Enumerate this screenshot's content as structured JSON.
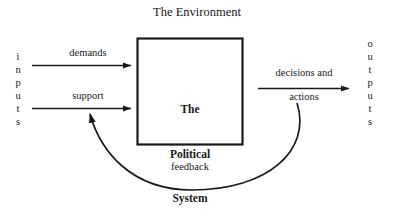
{
  "diagram": {
    "title": "The Environment",
    "background_color": "#ffffff",
    "ink_color": "#1a1a1a",
    "type": "systems-flow-diagram"
  },
  "central_box": {
    "label": "The\nPolitical\nSystem",
    "line1": "The",
    "line2": "Political",
    "line3": "System",
    "border_color": "#1a1a1a"
  },
  "inputs": {
    "stack_label": "inputs",
    "letters": [
      "i",
      "n",
      "p",
      "u",
      "t",
      "s"
    ],
    "flows": [
      {
        "label": "demands",
        "direction": "right"
      },
      {
        "label": "support",
        "direction": "right"
      }
    ]
  },
  "outputs": {
    "stack_label": "outputs",
    "letters": [
      "o",
      "u",
      "t",
      "p",
      "u",
      "t",
      "s"
    ],
    "flows": [
      {
        "label_above": "decisions and",
        "label_below": "actions",
        "direction": "right"
      }
    ]
  },
  "feedback": {
    "label": "feedback",
    "direction": "curve-right-to-left"
  }
}
